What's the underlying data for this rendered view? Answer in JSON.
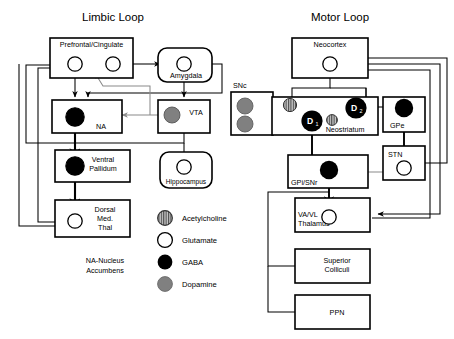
{
  "diagram": {
    "titles": {
      "limbic": "Limbic Loop",
      "motor": "Motor Loop"
    },
    "note": {
      "line1": "NA-Nucleus",
      "line2": "Accumbens"
    },
    "limbic_nodes": [
      {
        "id": "prefrontal",
        "label": "Prefrontal/Cingulate",
        "shape": "rect"
      },
      {
        "id": "amygdala",
        "label": "Amygdala",
        "shape": "rounded"
      },
      {
        "id": "na",
        "label": "NA",
        "shape": "rect"
      },
      {
        "id": "vta",
        "label": "VTA",
        "shape": "rect"
      },
      {
        "id": "ventral-pallidum",
        "label": "Ventral\nPallidum",
        "label1": "Ventral",
        "label2": "Pallidum",
        "shape": "rect"
      },
      {
        "id": "hippocampus",
        "label": "Hippocampus",
        "shape": "rounded"
      },
      {
        "id": "dorsal-med-thal",
        "label1": "Dorsal",
        "label2": "Med.",
        "label3": "Thal",
        "shape": "rect"
      }
    ],
    "motor_nodes": [
      {
        "id": "neocortex",
        "label": "Neocortex",
        "shape": "rect"
      },
      {
        "id": "snc",
        "label": "SNc",
        "shape": "rect"
      },
      {
        "id": "neostriatum",
        "label": "Neostriatum",
        "shape": "rect"
      },
      {
        "id": "gpe",
        "label": "GPe",
        "shape": "rect"
      },
      {
        "id": "stn",
        "label": "STN",
        "shape": "rect"
      },
      {
        "id": "gpi-snr",
        "label": "GPi/SNr",
        "shape": "rect"
      },
      {
        "id": "va-vl-thalamus",
        "label1": "VA/VL",
        "label2": "Thalamus",
        "shape": "rect"
      },
      {
        "id": "superior-colliculi",
        "label1": "Superior",
        "label2": "Colliculi",
        "shape": "rect"
      },
      {
        "id": "ppn",
        "label": "PPN",
        "shape": "rect"
      }
    ],
    "receptors": {
      "d1_main": "D",
      "d1_sub": "1",
      "d2_main": "D",
      "d2_sub": "2"
    },
    "legend": {
      "items": [
        {
          "key": "acetylcholine",
          "label": "Acetylcholine",
          "swatch": "hatched"
        },
        {
          "key": "glutamate",
          "label": "Glutamate",
          "swatch": "white"
        },
        {
          "key": "gaba",
          "label": "GABA",
          "swatch": "black"
        },
        {
          "key": "dopamine",
          "label": "Dopamine",
          "swatch": "gray"
        }
      ]
    },
    "colors": {
      "stroke": "#000000",
      "gaba": "#000000",
      "glutamate": "#ffffff",
      "dopamine": "#808080",
      "acetylcholine": "#9a9a9a",
      "gray_path": "#8a8a8a",
      "background": "#ffffff"
    }
  }
}
